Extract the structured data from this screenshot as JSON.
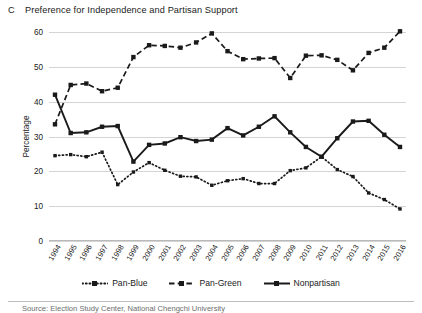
{
  "figure": {
    "panel_letter": "C",
    "title": "Preference for Independence and Partisan Support"
  },
  "footer": {
    "source_note": "Source: Election Study Center, National Chengchi University"
  },
  "chart_data": {
    "type": "line",
    "title": "Preference for Independence and Partisan Support",
    "xlabel": "",
    "ylabel": "Percentage",
    "ylim": [
      0,
      60
    ],
    "yticks": [
      0,
      10,
      20,
      30,
      40,
      50,
      60
    ],
    "grid": true,
    "legend_position": "bottom",
    "categories": [
      "1994",
      "1995",
      "1996",
      "1997",
      "1998",
      "1999",
      "2000",
      "2001",
      "2002",
      "2003",
      "2004",
      "2005",
      "2006",
      "2007",
      "2008",
      "2009",
      "2010",
      "2011",
      "2012",
      "2013",
      "2014",
      "2015",
      "2016"
    ],
    "series": [
      {
        "name": "Pan-Blue",
        "style": "dotted",
        "color": "#1a1a1a",
        "values": [
          24.5,
          24.8,
          24.2,
          25.5,
          16.2,
          19.8,
          22.5,
          20.3,
          18.6,
          18.4,
          16.0,
          17.3,
          17.9,
          16.5,
          16.5,
          20.2,
          21.0,
          24.2,
          20.5,
          18.5,
          13.8,
          11.9,
          9.2
        ]
      },
      {
        "name": "Pan-Green",
        "style": "dashed",
        "color": "#1a1a1a",
        "values": [
          33.5,
          44.8,
          45.2,
          43.0,
          44.0,
          52.8,
          56.2,
          56.0,
          55.5,
          57.0,
          59.6,
          54.5,
          52.2,
          52.4,
          52.5,
          46.8,
          53.2,
          53.3,
          52.0,
          49.0,
          54.0,
          55.5,
          60.2
        ]
      },
      {
        "name": "Nonpartisan",
        "style": "solid",
        "color": "#1a1a1a",
        "values": [
          42.0,
          31.0,
          31.2,
          32.8,
          33.0,
          22.8,
          27.6,
          28.0,
          29.8,
          28.7,
          29.1,
          32.4,
          30.3,
          32.8,
          35.8,
          31.2,
          27.0,
          24.2,
          29.5,
          34.3,
          34.5,
          30.5,
          27.0
        ]
      }
    ]
  },
  "legend": {
    "items": [
      {
        "label": "Pan-Blue"
      },
      {
        "label": "Pan-Green"
      },
      {
        "label": "Nonpartisan"
      }
    ]
  }
}
